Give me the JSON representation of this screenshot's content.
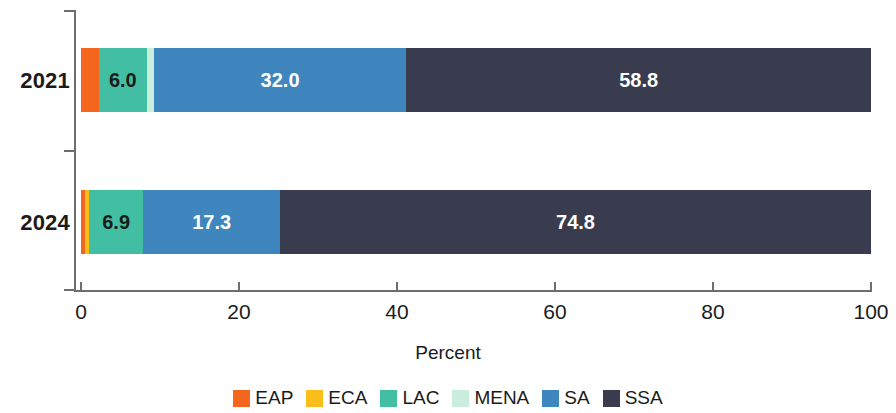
{
  "chart_data": {
    "type": "bar",
    "orientation": "horizontal",
    "stacked": true,
    "title": "",
    "xlabel": "Percent",
    "ylabel": "",
    "xlim": [
      0,
      100
    ],
    "xticks": [
      0,
      20,
      40,
      60,
      80,
      100
    ],
    "xtick_labels": [
      "0",
      "20",
      "40",
      "60",
      "80",
      "100"
    ],
    "grid": false,
    "legend_position": "bottom",
    "categories": [
      "2021",
      "2024"
    ],
    "series": [
      {
        "name": "EAP",
        "color": "#F4661E",
        "values": [
          2.3,
          0.5
        ],
        "labels": [
          "",
          ""
        ]
      },
      {
        "name": "ECA",
        "color": "#F9BE1A",
        "values": [
          0.0,
          0.5
        ],
        "labels": [
          "",
          ""
        ]
      },
      {
        "name": "LAC",
        "color": "#42BFA2",
        "values": [
          6.0,
          6.9
        ],
        "labels": [
          "6.0",
          "6.9"
        ]
      },
      {
        "name": "MENA",
        "color": "#C9EEDE",
        "values": [
          0.9,
          0.0
        ],
        "labels": [
          "",
          ""
        ]
      },
      {
        "name": "SA",
        "color": "#3F85BE",
        "values": [
          32.0,
          17.3
        ],
        "labels": [
          "32.0",
          "17.3"
        ]
      },
      {
        "name": "SSA",
        "color": "#383C4E",
        "values": [
          58.8,
          74.8
        ],
        "labels": [
          "58.8",
          "74.8"
        ]
      }
    ]
  },
  "axis": {
    "x_title": "Percent",
    "ticks": [
      {
        "value": "0"
      },
      {
        "value": "20"
      },
      {
        "value": "40"
      },
      {
        "value": "60"
      },
      {
        "value": "80"
      },
      {
        "value": "100"
      }
    ]
  },
  "bars": {
    "b2021": {
      "category": "2021",
      "segments": [
        {
          "series": "EAP",
          "label": "",
          "label_style": "none"
        },
        {
          "series": "LAC",
          "label": "6.0",
          "label_style": "dark"
        },
        {
          "series": "MENA",
          "label": "",
          "label_style": "none"
        },
        {
          "series": "SA",
          "label": "32.0",
          "label_style": "light"
        },
        {
          "series": "SSA",
          "label": "58.8",
          "label_style": "light"
        }
      ]
    },
    "b2024": {
      "category": "2024",
      "segments": [
        {
          "series": "EAP",
          "label": "",
          "label_style": "none"
        },
        {
          "series": "ECA",
          "label": "",
          "label_style": "none"
        },
        {
          "series": "LAC",
          "label": "6.9",
          "label_style": "dark"
        },
        {
          "series": "MENA",
          "label": "",
          "label_style": "none"
        },
        {
          "series": "SA",
          "label": "17.3",
          "label_style": "light"
        },
        {
          "series": "SSA",
          "label": "74.8",
          "label_style": "light"
        }
      ]
    }
  },
  "legend": {
    "items": [
      {
        "label": "EAP",
        "color": "#F4661E"
      },
      {
        "label": "ECA",
        "color": "#F9BE1A"
      },
      {
        "label": "LAC",
        "color": "#42BFA2"
      },
      {
        "label": "MENA",
        "color": "#C9EEDE"
      },
      {
        "label": "SA",
        "color": "#3F85BE"
      },
      {
        "label": "SSA",
        "color": "#383C4E"
      }
    ]
  }
}
